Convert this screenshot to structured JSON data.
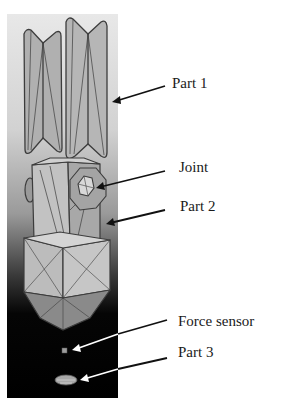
{
  "figure": {
    "labels": [
      {
        "id": "part1",
        "text": "Part 1"
      },
      {
        "id": "joint",
        "text": "Joint"
      },
      {
        "id": "part2",
        "text": "Part 2"
      },
      {
        "id": "force_sensor",
        "text": "Force sensor"
      },
      {
        "id": "part3",
        "text": "Part 3"
      }
    ],
    "colors": {
      "background": "#ffffff",
      "panel_top": "#e8e8e8",
      "panel_bottom": "#000000",
      "model_face": "#b4b4b4",
      "model_edge": "#3c3c3c",
      "arrow_dark": "#111111",
      "arrow_light": "#ffffff"
    }
  }
}
